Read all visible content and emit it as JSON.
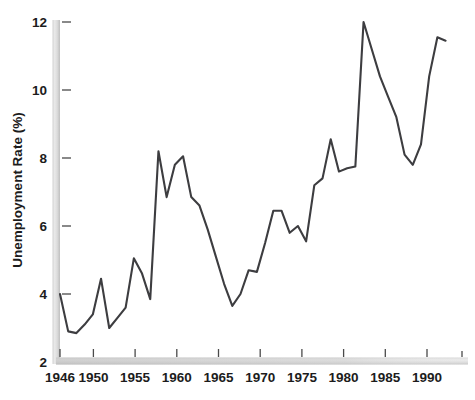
{
  "chart_data": {
    "type": "line",
    "title": "",
    "xlabel": "",
    "ylabel": "Unemployment Rate (%)",
    "xlim": [
      1946,
      1995
    ],
    "ylim": [
      2,
      12
    ],
    "grid": false,
    "legend": null,
    "series_name": "Unemployment Rate",
    "line_color": "#3d3d40",
    "y_ticks": [
      2,
      4,
      6,
      8,
      10,
      12
    ],
    "y_tick_labels": [
      "2",
      "4",
      "6",
      "8",
      "10",
      "12"
    ],
    "x_ticks": [
      1946,
      1950,
      1955,
      1960,
      1965,
      1970,
      1975,
      1980,
      1985,
      1990,
      1995
    ],
    "x_tick_labels": [
      "1946",
      "1950",
      "1955",
      "1960",
      "1965",
      "1970",
      "1975",
      "1980",
      "1985",
      "1990",
      ""
    ],
    "x": [
      1946,
      1947,
      1948,
      1949,
      1950,
      1951,
      1952,
      1953,
      1954,
      1955,
      1956,
      1957,
      1958,
      1959,
      1960,
      1961,
      1962,
      1963,
      1964,
      1965,
      1966,
      1967,
      1968,
      1969,
      1970,
      1971,
      1972,
      1973,
      1974,
      1975,
      1976,
      1977,
      1978,
      1979,
      1980,
      1981,
      1982,
      1983,
      1984,
      1985,
      1986,
      1987,
      1988,
      1989,
      1990,
      1991,
      1992,
      1993
    ],
    "values": [
      4.0,
      2.9,
      2.85,
      3.1,
      3.4,
      4.45,
      3.0,
      3.3,
      3.6,
      5.05,
      4.6,
      3.85,
      8.2,
      6.85,
      7.8,
      8.05,
      6.85,
      6.6,
      5.9,
      5.1,
      4.3,
      3.65,
      4.0,
      4.7,
      4.65,
      5.5,
      6.45,
      6.45,
      5.8,
      6.0,
      5.55,
      7.2,
      7.4,
      8.55,
      7.6,
      7.7,
      7.75,
      12.0,
      11.2,
      10.4,
      9.8,
      9.2,
      8.1,
      7.8,
      8.4,
      10.4,
      11.55,
      11.45
    ]
  },
  "axes": {
    "y_axis_name": "y-axis",
    "x_axis_name": "x-axis",
    "axis_bar_color_light": "#e4e4e4",
    "axis_bar_color_dark": "#b6b6b6"
  }
}
